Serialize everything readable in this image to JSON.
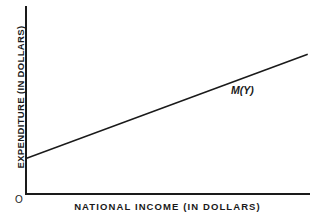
{
  "figure": {
    "background_color": "#ffffff",
    "ink_color": "#1a1a1a",
    "origin_label": "O",
    "curve_label": "M(Y)",
    "xlabel": "NATIONAL INCOME (IN DOLLARS)",
    "ylabel": "EXPENDITURE (IN DOLLARS)"
  },
  "chart_data": {
    "type": "line",
    "title": "",
    "subtitle": "",
    "xlabel": "NATIONAL INCOME (IN DOLLARS)",
    "ylabel": "EXPENDITURE (IN DOLLARS)",
    "grid": false,
    "legend_position": "none",
    "ticks": {
      "x": [],
      "y": []
    },
    "xlim": [
      0,
      1
    ],
    "ylim": [
      0,
      1
    ],
    "origin_marker": "O",
    "annotations": [
      {
        "text": "M(Y)",
        "x": 0.73,
        "y": 0.56,
        "style": "italic"
      }
    ],
    "series": [
      {
        "name": "M(Y)",
        "label": "M(Y)",
        "description": "Import (expenditure) function: linear, positive intercept, positive slope",
        "color": "#1a1a1a",
        "x": [
          0.0,
          1.0
        ],
        "values": [
          0.185,
          0.74
        ],
        "intercept": 0.185,
        "slope": 0.555
      }
    ]
  }
}
